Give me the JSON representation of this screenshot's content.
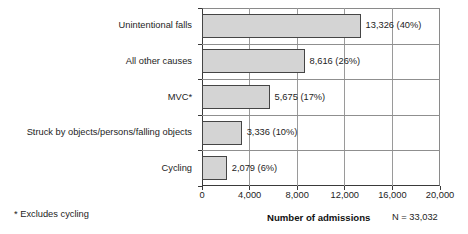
{
  "chart_data": {
    "type": "bar",
    "orientation": "horizontal",
    "title": "",
    "xlabel": "Number of admissions",
    "ylabel": "",
    "xlim": [
      0,
      20000
    ],
    "xticks": [
      0,
      4000,
      8000,
      12000,
      16000,
      20000
    ],
    "xtick_labels": [
      "0",
      "4,000",
      "8,000",
      "12,000",
      "16,000",
      "20,000"
    ],
    "grid": "vertical",
    "legend": "none",
    "categories": [
      "Unintentional falls",
      "All other causes",
      "MVC*",
      "Struck by objects/persons/falling objects",
      "Cycling"
    ],
    "values": [
      13326,
      8616,
      5675,
      3336,
      2079
    ],
    "percents": [
      "40%",
      "26%",
      "17%",
      "10%",
      "6%"
    ],
    "data_labels": [
      "13,326 (40%)",
      "8,616 (26%)",
      "5,675 (17%)",
      "3,336 (10%)",
      "2,079 (6%)"
    ],
    "annotations": {
      "footnote": "* Excludes cycling",
      "total": "N = 33,032"
    },
    "colors": {
      "bar_fill": "#d4d4d4",
      "bar_edge": "#454545",
      "axis": "#3a3a3a",
      "grid": "#9a9a9a",
      "text": "#1d1d1d",
      "background": "#ffffff"
    }
  }
}
